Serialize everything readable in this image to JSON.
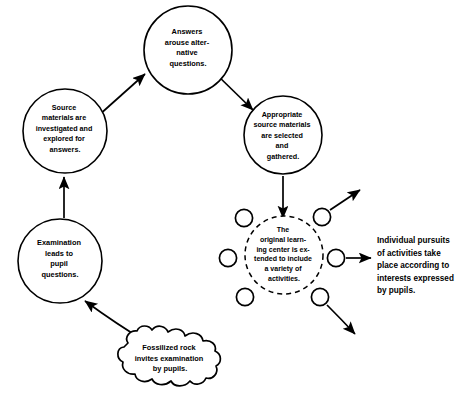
{
  "diagram": {
    "nodes": {
      "answers": {
        "label_lines": [
          "Answers",
          "arouse alter-",
          "native",
          "questions."
        ],
        "shape": "circle",
        "cx": 188,
        "cy": 50,
        "r": 44
      },
      "source_materials": {
        "label_lines": [
          "Source",
          "materials are",
          "investigated and",
          "explored for",
          "answers."
        ],
        "shape": "circle",
        "cx": 65,
        "cy": 131,
        "r": 42
      },
      "appropriate": {
        "label_lines": [
          "Appropriate",
          "source materials",
          "are selected",
          "and",
          "gathered."
        ],
        "shape": "circle",
        "cx": 283,
        "cy": 135,
        "r": 39
      },
      "examination": {
        "label_lines": [
          "Examination",
          "leads to",
          "pupil",
          "questions."
        ],
        "shape": "circle",
        "cx": 60,
        "cy": 261,
        "r": 42
      },
      "learning_center": {
        "label_lines": [
          "The",
          "original learn-",
          "ing center is ex-",
          "tended to include",
          "a variety of",
          "activities."
        ],
        "shape": "dashed-circle",
        "cx": 284,
        "cy": 255,
        "r": 39
      },
      "fossil": {
        "label_lines": [
          "Fossilized rock",
          "invites examination",
          "by pupils."
        ],
        "shape": "blob",
        "cx": 172,
        "cy": 360
      }
    },
    "satellites": [
      {
        "name": "satellite-top-left",
        "cx": 244,
        "cy": 218,
        "r": 9
      },
      {
        "name": "satellite-top-right",
        "cx": 322,
        "cy": 217,
        "r": 9
      },
      {
        "name": "satellite-mid-left",
        "cx": 228,
        "cy": 258,
        "r": 9
      },
      {
        "name": "satellite-mid-right",
        "cx": 336,
        "cy": 258,
        "r": 9
      },
      {
        "name": "satellite-bottom-left",
        "cx": 245,
        "cy": 297,
        "r": 9
      },
      {
        "name": "satellite-bottom-right",
        "cx": 320,
        "cy": 297,
        "r": 9
      },
      {
        "name": "satellite-upper-center-left",
        "cx": 244,
        "cy": 218,
        "r": 9
      },
      {
        "name": "satellite-lower-center-right",
        "cx": 320,
        "cy": 297,
        "r": 9
      }
    ],
    "side_note": {
      "lines": [
        "Individual pursuits",
        "of activities take",
        "place according to",
        "interests expressed",
        "by pupils."
      ],
      "x": 377,
      "y": 241
    },
    "colors": {
      "stroke": "#000000",
      "fill": "#ffffff",
      "background": "#ffffff"
    }
  }
}
